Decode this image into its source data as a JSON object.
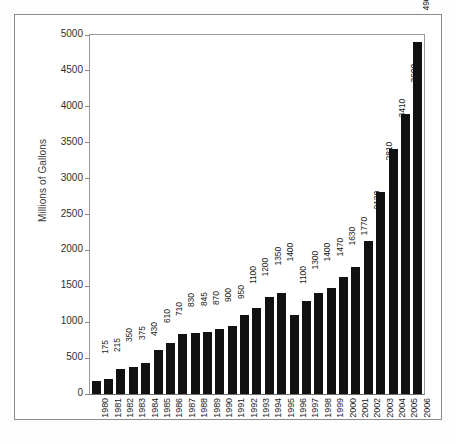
{
  "chart_data": {
    "type": "bar",
    "title": "",
    "xlabel": "",
    "ylabel": "Millions of Gallons",
    "ylim": [
      0,
      5000
    ],
    "yticks": [
      0,
      500,
      1000,
      1500,
      2000,
      2500,
      3000,
      3500,
      4000,
      4500,
      5000
    ],
    "grid": false,
    "legend": null,
    "bar_color": "#111111",
    "categories": [
      "1980",
      "1981",
      "1982",
      "1983",
      "1984",
      "1985",
      "1986",
      "1987",
      "1988",
      "1989",
      "1990",
      "1991",
      "1992",
      "1993",
      "1994",
      "1995",
      "1996",
      "1997",
      "1998",
      "1999",
      "2000",
      "2001",
      "2002",
      "2003",
      "2004",
      "2005",
      "2006"
    ],
    "values": [
      175,
      215,
      350,
      375,
      430,
      610,
      710,
      830,
      845,
      870,
      900,
      950,
      1100,
      1200,
      1350,
      1400,
      1100,
      1300,
      1400,
      1470,
      1630,
      1770,
      2130,
      2810,
      3410,
      3900,
      4900
    ],
    "data_labels": [
      "175",
      "215",
      "350",
      "375",
      "430",
      "610",
      "710",
      "830",
      "845",
      "870",
      "900",
      "950",
      "1100",
      "1200",
      "1350",
      "1400",
      "1100",
      "1300",
      "1400",
      "1470",
      "1630",
      "1770",
      "2130",
      "2810",
      "3410",
      "3900",
      "4900"
    ]
  }
}
